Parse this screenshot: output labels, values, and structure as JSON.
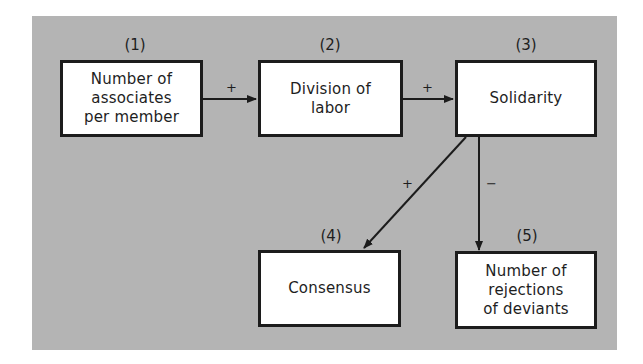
{
  "diagram": {
    "nodes": [
      {
        "id": 1,
        "number": "(1)",
        "label": "Number of\nassociates\nper member"
      },
      {
        "id": 2,
        "number": "(2)",
        "label": "Division of\nlabor"
      },
      {
        "id": 3,
        "number": "(3)",
        "label": "Solidarity"
      },
      {
        "id": 4,
        "number": "(4)",
        "label": "Consensus"
      },
      {
        "id": 5,
        "number": "(5)",
        "label": "Number of\nrejections\nof deviants"
      }
    ],
    "edges": [
      {
        "from": 1,
        "to": 2,
        "sign": "+"
      },
      {
        "from": 2,
        "to": 3,
        "sign": "+"
      },
      {
        "from": 3,
        "to": 4,
        "sign": "+"
      },
      {
        "from": 3,
        "to": 5,
        "sign": "−"
      }
    ],
    "colors": {
      "background": "#b4b4b4",
      "box": "#ffffff",
      "stroke": "#1c1c1c"
    }
  }
}
